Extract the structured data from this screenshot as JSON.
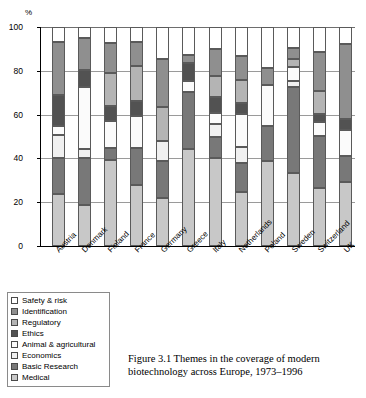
{
  "figure": {
    "caption": "Figure 3.1  Themes in the coverage of modern biotechnology across Europe, 1973–1996"
  },
  "legend": {
    "items": [
      {
        "label": "Safety & risk",
        "color": "#ffffff"
      },
      {
        "label": "Identification",
        "color": "#8f8f8f"
      },
      {
        "label": "Regulatory",
        "color": "#b4b4b4"
      },
      {
        "label": "Ethics",
        "color": "#525252"
      },
      {
        "label": "Animal & agricultural",
        "color": "#fbfbfb"
      },
      {
        "label": "Economics",
        "color": "#f0f0f0"
      },
      {
        "label": "Basic Research",
        "color": "#787878"
      },
      {
        "label": "Medical",
        "color": "#c8c8c8"
      }
    ]
  },
  "chart_data": {
    "type": "bar",
    "subtype": "stacked-100",
    "title": "",
    "xlabel": "",
    "ylabel": "%",
    "ylim": [
      0,
      100
    ],
    "yticks": [
      0,
      20,
      40,
      60,
      80,
      100
    ],
    "grid": true,
    "legend_position": "below-left",
    "categories": [
      "Austria",
      "Denmark",
      "Finland",
      "France",
      "Germany",
      "Greece",
      "Italy",
      "Netherlands",
      "Poland",
      "Sweden",
      "Switzerland",
      "UK"
    ],
    "series": [
      {
        "name": "Medical",
        "color": "#c8c8c8",
        "values": [
          23.8,
          18.6,
          39.2,
          27.9,
          21.8,
          44.2,
          40.1,
          24.5,
          38.8,
          33.3,
          26.3,
          29.2
        ]
      },
      {
        "name": "Basic Research",
        "color": "#787878",
        "values": [
          16.6,
          21.5,
          5.4,
          17.0,
          17.2,
          26.2,
          9.8,
          13.5,
          15.8,
          39.2,
          23.9,
          12.0
        ]
      },
      {
        "name": "Economics",
        "color": "#f0f0f0",
        "values": [
          10.3,
          4.2,
          0.0,
          0.0,
          8.9,
          0.0,
          5.6,
          7.3,
          0.0,
          3.0,
          0.0,
          0.0
        ]
      },
      {
        "name": "Animal & agri.",
        "color": "#fbfbfb",
        "values": [
          4.2,
          28.5,
          12.7,
          14.4,
          0.0,
          5.0,
          5.2,
          14.8,
          18.8,
          6.1,
          6.5,
          12.0
        ]
      },
      {
        "name": "Ethics",
        "color": "#525252",
        "values": [
          13.9,
          7.6,
          6.6,
          7.0,
          0.0,
          8.1,
          7.2,
          5.2,
          0.0,
          0.0,
          3.8,
          4.9
        ]
      },
      {
        "name": "Regulatory",
        "color": "#b4b4b4",
        "values": [
          0.0,
          0.0,
          15.0,
          15.7,
          15.8,
          0.0,
          9.8,
          10.6,
          0.0,
          3.8,
          10.3,
          0.0
        ]
      },
      {
        "name": "Identification",
        "color": "#8f8f8f",
        "values": [
          24.4,
          14.6,
          13.7,
          11.0,
          21.5,
          3.8,
          12.2,
          10.7,
          8.1,
          4.8,
          17.8,
          34.3
        ]
      },
      {
        "name": "Safety & risk",
        "color": "#ffffff",
        "values": [
          6.8,
          5.0,
          7.4,
          7.0,
          14.8,
          12.7,
          10.1,
          13.4,
          18.5,
          9.8,
          11.4,
          7.6
        ]
      }
    ],
    "bars": [
      {
        "country": "Austria",
        "stops": [
          0,
          23.8,
          40.4,
          50.7,
          54.9,
          68.8,
          68.8,
          93.2,
          100
        ]
      },
      {
        "country": "Denmark",
        "stops": [
          0,
          18.6,
          40.1,
          44.3,
          72.8,
          80.4,
          80.4,
          95.0,
          100
        ]
      },
      {
        "country": "Finland",
        "stops": [
          0,
          39.2,
          44.6,
          44.6,
          57.3,
          63.9,
          78.9,
          92.6,
          100
        ]
      },
      {
        "country": "France",
        "stops": [
          0,
          27.9,
          44.9,
          44.9,
          59.3,
          66.3,
          82.0,
          93.0,
          100
        ]
      },
      {
        "country": "Germany",
        "stops": [
          0,
          21.8,
          39.0,
          47.9,
          47.9,
          47.9,
          63.7,
          85.2,
          100
        ]
      },
      {
        "country": "Greece",
        "stops": [
          0,
          44.2,
          70.4,
          70.4,
          75.4,
          83.5,
          83.5,
          87.3,
          100
        ]
      },
      {
        "country": "Italy",
        "stops": [
          0,
          40.1,
          49.9,
          55.5,
          60.7,
          67.9,
          77.7,
          89.9,
          100
        ]
      },
      {
        "country": "Netherlands",
        "stops": [
          0,
          24.5,
          38.0,
          45.3,
          60.1,
          65.3,
          75.9,
          86.6,
          100
        ]
      },
      {
        "country": "Poland",
        "stops": [
          0,
          38.8,
          54.6,
          54.6,
          73.4,
          73.4,
          73.4,
          81.5,
          100
        ]
      },
      {
        "country": "Sweden",
        "stops": [
          0,
          33.3,
          72.5,
          75.5,
          81.6,
          81.6,
          85.4,
          90.2,
          100
        ]
      },
      {
        "country": "Switzerland",
        "stops": [
          0,
          26.3,
          50.2,
          50.2,
          56.7,
          60.5,
          70.8,
          88.6,
          100
        ]
      },
      {
        "country": "UK",
        "stops": [
          0,
          29.2,
          41.2,
          41.2,
          53.2,
          58.1,
          58.1,
          92.4,
          100
        ]
      }
    ]
  }
}
